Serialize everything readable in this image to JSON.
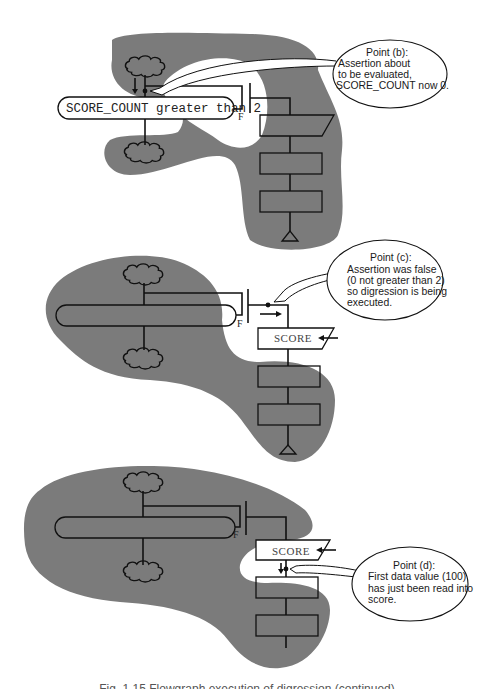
{
  "figure": {
    "panels": [
      {
        "id": "b",
        "assertion_label": "SCORE_COUNT greater than 2",
        "false_label": "F",
        "callout": {
          "title": "Point (b):",
          "lines": [
            "Assertion about",
            "to be evaluated,",
            "SCORE_COUNT now 0."
          ]
        }
      },
      {
        "id": "c",
        "false_label": "F",
        "input_label": "SCORE",
        "callout": {
          "title": "Point (c):",
          "lines": [
            "Assertion was false",
            "(0 not greater than 2)",
            "so digression is being",
            "executed."
          ]
        }
      },
      {
        "id": "d",
        "false_label": "F",
        "input_label": "SCORE",
        "callout": {
          "title": "Point (d):",
          "lines": [
            "First data value (100)",
            "has just been read into",
            "score."
          ]
        }
      }
    ],
    "caption": "Fig. 1.15 Flowgraph execution of digression (continued)"
  },
  "colors": {
    "shading": "#7b7b7b",
    "line": "#111111",
    "background": "#ffffff"
  }
}
